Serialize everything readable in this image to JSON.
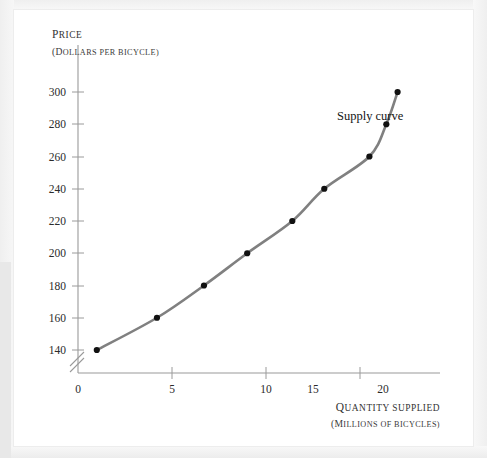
{
  "figure": {
    "background_color": "#ffffff",
    "page_color": "#f2f2f2",
    "curve_color": "#808080",
    "marker_color": "#111111",
    "axis_color": "#8c8c8c",
    "text_color": "#2b2b2b"
  },
  "chart_data": {
    "type": "line",
    "title": "",
    "subtitle": "",
    "curve_label": "Supply curve",
    "ylabel_lead": "P",
    "ylabel_rest": "RICE",
    "ylabel_full": "PRICE",
    "ysublabel_lead": "(D",
    "ysublabel_rest": "OLLARS PER BICYCLE)",
    "ysublabel_full": "(DOLLARS PER BICYCLE)",
    "xlabel_lead": "Q",
    "xlabel_rest": "UANTITY SUPPLIED",
    "xlabel_full": "QUANTITY SUPPLIED",
    "xsublabel_lead": "(M",
    "xsublabel_rest": "ILLIONS OF BICYCLES)",
    "xsublabel_full": "(MILLIONS OF BICYCLES)",
    "x": [
      1,
      4.2,
      6.7,
      9,
      11.4,
      13.1,
      15.5,
      16.4,
      17
    ],
    "values": [
      140,
      160,
      180,
      200,
      220,
      240,
      260,
      280,
      300
    ],
    "series": [
      {
        "name": "Supply curve",
        "points": [
          {
            "x": 1,
            "y": 140
          },
          {
            "x": 4.2,
            "y": 160
          },
          {
            "x": 6.7,
            "y": 180
          },
          {
            "x": 9,
            "y": 200
          },
          {
            "x": 11.4,
            "y": 220
          },
          {
            "x": 13.1,
            "y": 240
          },
          {
            "x": 15.5,
            "y": 260
          },
          {
            "x": 16.4,
            "y": 280
          },
          {
            "x": 17,
            "y": 300
          }
        ]
      }
    ],
    "xticks": [
      0,
      5,
      10,
      15,
      20
    ],
    "xtick_labels": [
      "0",
      "5",
      "10",
      "15",
      "20"
    ],
    "yticks": [
      140,
      160,
      180,
      200,
      220,
      240,
      260,
      280,
      300
    ],
    "ytick_labels": [
      "140",
      "160",
      "180",
      "200",
      "220",
      "240",
      "260",
      "280",
      "300"
    ],
    "xlim": [
      0,
      22
    ],
    "ylim": [
      130,
      308
    ],
    "grid": false,
    "legend": "none",
    "axis_break": true,
    "axis_break_note": "double slash break on y-axis below 140"
  }
}
